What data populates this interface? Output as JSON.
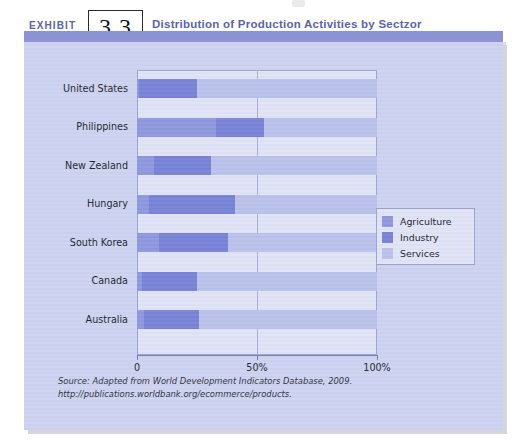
{
  "header": {
    "exhibit_word": "EXHIBIT",
    "exhibit_number": "3.3",
    "title": "Distribution of Production Activities by Sectzor"
  },
  "source": {
    "text": "Source: Adapted from World Development Indicators Database, 2009. http://publications.worldbank.org/ecommerce/products."
  },
  "colors": {
    "agriculture": "#8c96dd",
    "industry": "#7681d6",
    "services": "#b9c1ea",
    "panel_background": "#ccd2ef",
    "plot_background": "#dfe3f5",
    "header_band": "#8b93d4",
    "title_text": "#5a63b0"
  },
  "chart_data": {
    "type": "bar",
    "orientation": "horizontal",
    "stacked": true,
    "stack_total": 100,
    "title": "Distribution of Production Activities by Sectzor",
    "xlabel": "",
    "ylabel": "",
    "xlim": [
      0,
      100
    ],
    "xticks": [
      0,
      50,
      100
    ],
    "xtick_labels": [
      "0",
      "50%",
      "100%"
    ],
    "grid": false,
    "legend_position": "right-inside",
    "categories": [
      "United States",
      "Philippines",
      "New Zealand",
      "Hungary",
      "South Korea",
      "Canada",
      "Australia"
    ],
    "series": [
      {
        "name": "Agriculture",
        "color": "#8c96dd",
        "values": [
          1,
          33,
          7,
          5,
          9,
          2,
          3
        ]
      },
      {
        "name": "Industry",
        "color": "#7681d6",
        "values": [
          24,
          20,
          24,
          36,
          29,
          23,
          23
        ]
      },
      {
        "name": "Services",
        "color": "#b9c1ea",
        "values": [
          75,
          47,
          69,
          59,
          62,
          75,
          74
        ]
      }
    ]
  }
}
